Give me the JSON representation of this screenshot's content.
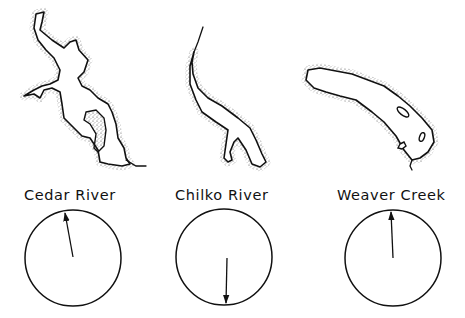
{
  "figure": {
    "type": "lake maps with orientation compasses",
    "panels": [
      {
        "id": "cedar",
        "label": "Cedar River",
        "compass": {
          "cx": 73,
          "cy": 258,
          "r": 48,
          "arrow_bearing_deg": 350,
          "arrow_direction": "north (slightly west)"
        }
      },
      {
        "id": "chilko",
        "label": "Chilko River",
        "compass": {
          "cx": 224,
          "cy": 257,
          "r": 48,
          "arrow_bearing_deg": 180,
          "arrow_direction": "south"
        }
      },
      {
        "id": "weaver",
        "label": "Weaver Creek",
        "compass": {
          "cx": 393,
          "cy": 258,
          "r": 48,
          "arrow_bearing_deg": 358,
          "arrow_direction": "north"
        }
      }
    ],
    "colors": {
      "ink": "#111111",
      "background": "#ffffff"
    }
  }
}
